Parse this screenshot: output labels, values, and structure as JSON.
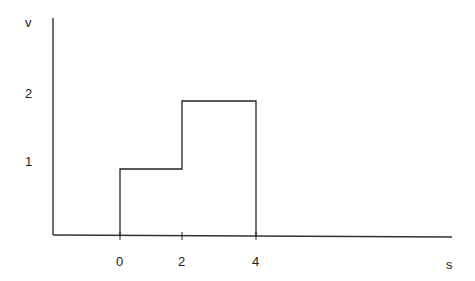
{
  "diagram": {
    "type": "step-function",
    "y_axis_label": "v",
    "x_axis_label": "s",
    "y_ticks": [
      "1",
      "2"
    ],
    "x_ticks": [
      "0",
      "2",
      "4"
    ],
    "segments": [
      {
        "from": 0,
        "to": 2,
        "value": 1
      },
      {
        "from": 2,
        "to": 4,
        "value": 2
      }
    ],
    "line_color": "#222222"
  }
}
